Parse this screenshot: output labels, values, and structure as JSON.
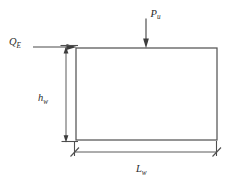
{
  "diagram": {
    "background_color": "#ffffff",
    "line_color": "#4a4a4a",
    "labels": {
      "axial_load": {
        "symbol": "P",
        "subscript": "u"
      },
      "lateral_load": {
        "symbol": "Q",
        "subscript": "E"
      },
      "wall_height": {
        "symbol": "h",
        "subscript": "w"
      },
      "wall_length": {
        "symbol": "L",
        "subscript": "w"
      }
    },
    "wall": {
      "left": 76,
      "top": 48,
      "right": 217,
      "bottom": 140
    },
    "loads": {
      "axial": {
        "name": "axial-load-arrow",
        "direction": "down",
        "x": 146,
        "y_start": 18,
        "y_end": 48
      },
      "lateral": {
        "name": "lateral-load-arrow",
        "direction": "right",
        "y": 47,
        "x_start": 33,
        "x_end": 76
      }
    },
    "dimensions": {
      "height": {
        "name": "height-dimension",
        "x": 66,
        "y_start": 48,
        "y_end": 142,
        "label_x": 44,
        "label_y": 98
      },
      "length": {
        "name": "length-dimension",
        "y": 152,
        "x_start": 74,
        "x_end": 216,
        "label_x": 140,
        "label_y": 170
      }
    }
  }
}
